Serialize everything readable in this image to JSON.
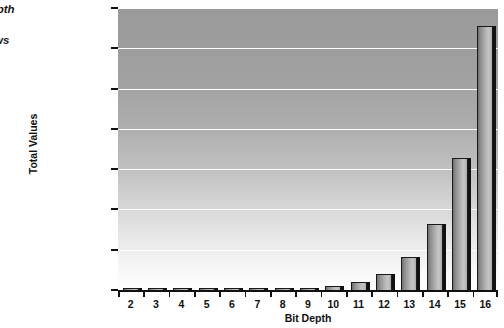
{
  "caption": {
    "lines": [
      "bit depth",
      "er of",
      "s grows"
    ]
  },
  "chart_data": {
    "type": "bar",
    "title": "",
    "xlabel": "Bit Depth",
    "ylabel": "Total Values",
    "categories": [
      "2",
      "3",
      "4",
      "5",
      "6",
      "7",
      "8",
      "9",
      "10",
      "11",
      "12",
      "13",
      "14",
      "15",
      "16"
    ],
    "values": [
      4,
      8,
      16,
      32,
      64,
      128,
      256,
      512,
      1024,
      2048,
      4096,
      8192,
      16384,
      32768,
      65536
    ],
    "ylim": [
      0,
      70000
    ],
    "yticks": [
      0,
      10000,
      20000,
      30000,
      40000,
      50000,
      60000,
      70000
    ],
    "ytick_labels": [
      "0",
      "10,000",
      "20,000",
      "30,000",
      "40,000",
      "50,000",
      "60,000",
      "70,000"
    ],
    "grid": true,
    "legend": "none",
    "bar_color": "#b4b4b4",
    "bar_edge_color": "#1a1a1a",
    "bar_shadow_color": "#111111",
    "plot_bg_top": "#9a9a9a",
    "plot_bg_bottom": "#ffffff",
    "gridline_color": "#ffffff"
  }
}
